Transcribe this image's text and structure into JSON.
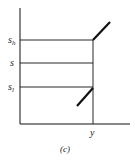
{
  "figure": {
    "caption": "(c)",
    "x_axis_label": "y",
    "y_levels": [
      {
        "name": "s_h",
        "base": "s",
        "sub": "h"
      },
      {
        "name": "s",
        "base": "s",
        "sub": ""
      },
      {
        "name": "s_l",
        "base": "s",
        "sub": "l"
      }
    ],
    "colors": {
      "line": "#111111",
      "background": "#ffffff"
    }
  }
}
